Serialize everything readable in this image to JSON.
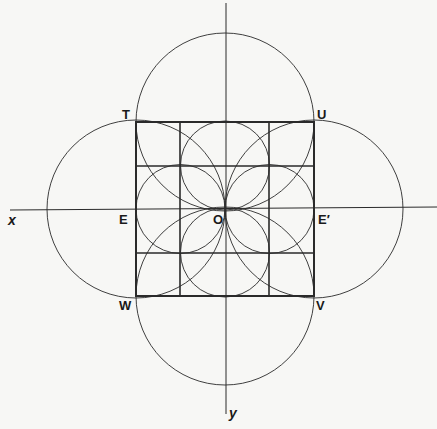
{
  "figure": {
    "labels": {
      "T": "T",
      "U": "U",
      "W": "W",
      "V": "V",
      "E": "E",
      "E_prime": "E′",
      "O": "O",
      "x_axis": "x",
      "y_axis": "y"
    },
    "colors": {
      "stroke": "#2a2a2a",
      "background": "#f7f7f5"
    },
    "geometry": {
      "center_O": [
        225,
        209
      ],
      "square_corners": {
        "T": [
          136,
          122
        ],
        "U": [
          314,
          122
        ],
        "V": [
          314,
          296
        ],
        "W": [
          136,
          296
        ]
      },
      "large_circle_radius": 89,
      "small_circle_radius": 44.5,
      "grid_divisions": 4
    }
  }
}
